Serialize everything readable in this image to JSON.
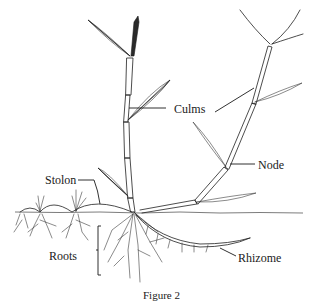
{
  "figure": {
    "caption": "Figure 2",
    "labels": {
      "culms": "Culms",
      "node": "Node",
      "stolon": "Stolon",
      "roots": "Roots",
      "rhizome": "Rhizome"
    }
  },
  "colors": {
    "background": "#ffffff",
    "ink": "#1f1f1f"
  }
}
